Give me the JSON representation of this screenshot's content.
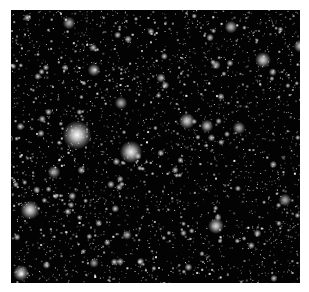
{
  "image": {
    "description": "Dense star field, astronomical image, grayscale",
    "background_color": "#030303",
    "page_color": "#ffffff",
    "field": {
      "x": 11,
      "y": 10,
      "width": 289,
      "height": 273
    },
    "bright_stars": [
      {
        "x": 66,
        "y": 125,
        "r": 9,
        "b": 1.0
      },
      {
        "x": 120,
        "y": 142,
        "r": 7,
        "b": 0.95
      },
      {
        "x": 19,
        "y": 200,
        "r": 6,
        "b": 0.9
      },
      {
        "x": 176,
        "y": 111,
        "r": 5,
        "b": 0.85
      },
      {
        "x": 252,
        "y": 50,
        "r": 5,
        "b": 0.85
      },
      {
        "x": 289,
        "y": 36,
        "r": 4,
        "b": 0.8
      },
      {
        "x": 205,
        "y": 216,
        "r": 5,
        "b": 0.85
      },
      {
        "x": 10,
        "y": 263,
        "r": 5,
        "b": 0.85
      },
      {
        "x": 196,
        "y": 116,
        "r": 4,
        "b": 0.8
      },
      {
        "x": 83,
        "y": 60,
        "r": 4,
        "b": 0.75
      },
      {
        "x": 220,
        "y": 17,
        "r": 4,
        "b": 0.75
      },
      {
        "x": 58,
        "y": 13,
        "r": 4,
        "b": 0.7
      },
      {
        "x": 228,
        "y": 118,
        "r": 4,
        "b": 0.7
      },
      {
        "x": 274,
        "y": 190,
        "r": 4,
        "b": 0.7
      },
      {
        "x": 110,
        "y": 93,
        "r": 4,
        "b": 0.7
      },
      {
        "x": 43,
        "y": 162,
        "r": 4,
        "b": 0.7
      },
      {
        "x": 150,
        "y": 68,
        "r": 3,
        "b": 0.7
      },
      {
        "x": 205,
        "y": 55,
        "r": 3,
        "b": 0.7
      },
      {
        "x": 116,
        "y": 225,
        "r": 3,
        "b": 0.7
      },
      {
        "x": 83,
        "y": 253,
        "r": 3,
        "b": 0.65
      }
    ],
    "faint_star_count": 2600,
    "seed": 12345
  }
}
